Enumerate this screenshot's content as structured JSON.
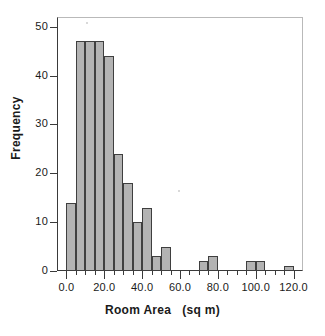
{
  "chart_data": {
    "type": "bar",
    "title": "",
    "subtitle": "",
    "xlabel": "Room Area   (sq m)",
    "ylabel": "Frequency",
    "xlim": [
      -5,
      125
    ],
    "ylim": [
      0,
      52
    ],
    "grid": false,
    "legend": null,
    "bin_width": 5,
    "xtick_labels": [
      "0.0",
      "20.0",
      "40.0",
      "60.0",
      "80.0",
      "100.0",
      "120.0"
    ],
    "xtick_values": [
      0,
      20,
      40,
      60,
      80,
      100,
      120
    ],
    "ytick_labels": [
      "0",
      "10",
      "20",
      "30",
      "40",
      "50"
    ],
    "ytick_values": [
      0,
      10,
      20,
      30,
      40,
      50
    ],
    "bin_edges": [
      0,
      5,
      10,
      15,
      20,
      25,
      30,
      35,
      40,
      45,
      50,
      55,
      60,
      65,
      70,
      75,
      80,
      85,
      90,
      95,
      100,
      105,
      110,
      115,
      120
    ],
    "categories": [
      "0-5",
      "5-10",
      "10-15",
      "15-20",
      "20-25",
      "25-30",
      "30-35",
      "35-40",
      "40-45",
      "45-50",
      "50-55",
      "55-60",
      "60-65",
      "65-70",
      "70-75",
      "75-80",
      "80-85",
      "85-90",
      "90-95",
      "95-100",
      "100-105",
      "105-110",
      "110-115",
      "115-120"
    ],
    "values": [
      14,
      47,
      47,
      47,
      44,
      24,
      18,
      10,
      13,
      3,
      5,
      0,
      0,
      2,
      3,
      0,
      0,
      0,
      2,
      2,
      0,
      0,
      1,
      0
    ],
    "bars": [
      {
        "x0": 0,
        "x1": 5,
        "value": 14
      },
      {
        "x0": 5,
        "x1": 10,
        "value": 47
      },
      {
        "x0": 10,
        "x1": 15,
        "value": 47
      },
      {
        "x0": 15,
        "x1": 20,
        "value": 47
      },
      {
        "x0": 20,
        "x1": 25,
        "value": 44
      },
      {
        "x0": 25,
        "x1": 30,
        "value": 24
      },
      {
        "x0": 30,
        "x1": 35,
        "value": 18
      },
      {
        "x0": 35,
        "x1": 40,
        "value": 10
      },
      {
        "x0": 40,
        "x1": 45,
        "value": 13
      },
      {
        "x0": 45,
        "x1": 50,
        "value": 3
      },
      {
        "x0": 50,
        "x1": 55,
        "value": 5
      },
      {
        "x0": 70,
        "x1": 75,
        "value": 2
      },
      {
        "x0": 75,
        "x1": 80,
        "value": 3
      },
      {
        "x0": 95,
        "x1": 100,
        "value": 2
      },
      {
        "x0": 100,
        "x1": 105,
        "value": 2
      },
      {
        "x0": 115,
        "x1": 120,
        "value": 1
      }
    ],
    "colors": {
      "bar_fill": "#b3b3b3",
      "bar_edge": "#3f3f3f",
      "axis": "#3a3a3a",
      "frame": "#b9b9b9",
      "text": "#1a1a1a",
      "background": "#ffffff"
    }
  }
}
